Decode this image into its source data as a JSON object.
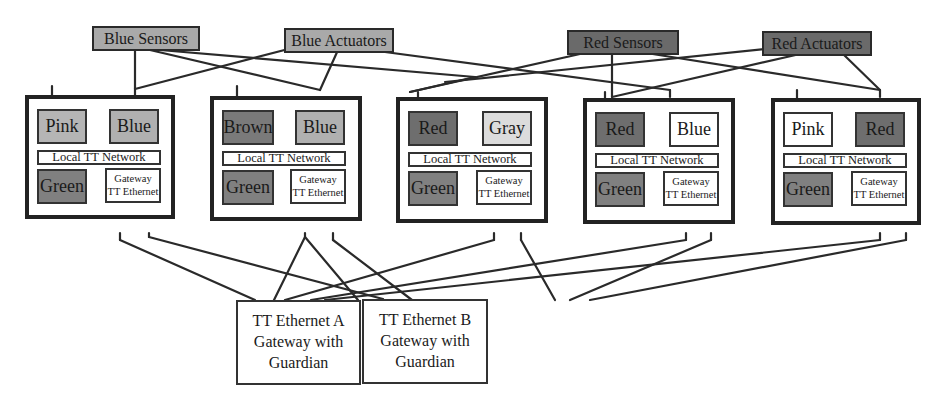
{
  "colors": {
    "pink": "#b5b5b5",
    "blue": "#b0b0b0",
    "brown": "#7a7a7a",
    "green": "#808080",
    "red": "#6e6e6e",
    "gray": "#dcdcdc",
    "white": "#ffffff",
    "blue_label": "#a9a9a9",
    "red_label": "#6a6a6a"
  },
  "top_labels": [
    {
      "id": "blue-sensors",
      "text": "Blue Sensors"
    },
    {
      "id": "blue-actuators",
      "text": "Blue Actuators"
    },
    {
      "id": "red-sensors",
      "text": "Red Sensors"
    },
    {
      "id": "red-actuators",
      "text": "Red Actuators"
    }
  ],
  "nodes": [
    {
      "left": {
        "text": "Pink",
        "fill": "#b5b5b5"
      },
      "right": {
        "text": "Blue",
        "fill": "#b0b0b0"
      },
      "network": "Local TT Network",
      "bottom_left": "Green",
      "gateway": [
        "Gateway",
        "TT Ethernet"
      ]
    },
    {
      "left": {
        "text": "Brown",
        "fill": "#7a7a7a"
      },
      "right": {
        "text": "Blue",
        "fill": "#b0b0b0"
      },
      "network": "Local TT Network",
      "bottom_left": "Green",
      "gateway": [
        "Gateway",
        "TT Ethernet"
      ]
    },
    {
      "left": {
        "text": "Red",
        "fill": "#6e6e6e"
      },
      "right": {
        "text": "Gray",
        "fill": "#dcdcdc"
      },
      "network": "Local TT Network",
      "bottom_left": "Green",
      "gateway": [
        "Gateway",
        "TT Ethernet"
      ]
    },
    {
      "left": {
        "text": "Red",
        "fill": "#6e6e6e"
      },
      "right": {
        "text": "Blue",
        "fill": "#ffffff"
      },
      "network": "Local TT Network",
      "bottom_left": "Green",
      "gateway": [
        "Gateway",
        "TT Ethernet"
      ]
    },
    {
      "left": {
        "text": "Pink",
        "fill": "#ffffff"
      },
      "right": {
        "text": "Red",
        "fill": "#6e6e6e"
      },
      "network": "Local TT Network",
      "bottom_left": "Green",
      "gateway": [
        "Gateway",
        "TT Ethernet"
      ]
    }
  ],
  "tt_ethernet": [
    {
      "lines": [
        "TT Ethernet A",
        "Gateway with",
        "Guardian"
      ]
    },
    {
      "lines": [
        "TT Ethernet B",
        "Gateway with",
        "Guardian"
      ]
    }
  ]
}
